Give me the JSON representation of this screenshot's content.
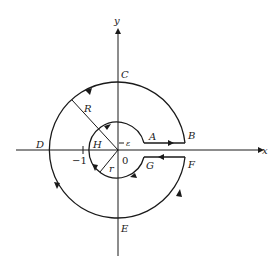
{
  "figure": {
    "axes": {
      "x_label": "x",
      "y_label": "y"
    },
    "points": {
      "A": "A",
      "B": "B",
      "C": "C",
      "D": "D",
      "E": "E",
      "F": "F",
      "G": "G",
      "H": "H"
    },
    "radii": {
      "outer": "R",
      "inner": "r"
    },
    "gap_label": "ε",
    "ticks": {
      "minus_one": "−1",
      "origin": "0"
    },
    "colors": {
      "stroke": "#1a1a1a",
      "background": "#ffffff"
    }
  }
}
